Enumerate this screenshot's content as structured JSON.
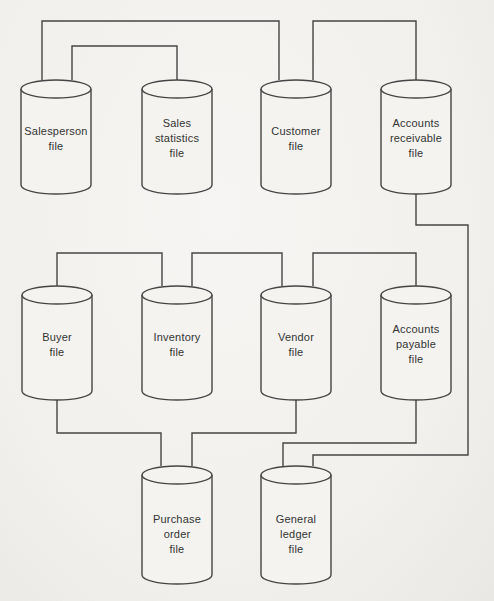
{
  "figure": {
    "description_type": "flat-file-database-diagram",
    "colors": {
      "background": "#f2f0ed",
      "stroke": "#454545",
      "text": "#333333",
      "cylinder_fill": "#f4f3f0"
    },
    "cylinder_symbol": {
      "meaning": "disk-file",
      "width": 70,
      "ellipse_ry": 9,
      "body_height": 96
    },
    "nodes": [
      {
        "id": "salesperson-file",
        "label_lines": [
          "Salesperson",
          "file"
        ],
        "cx": 56,
        "top": 80
      },
      {
        "id": "sales-statistics-file",
        "label_lines": [
          "Sales",
          "statistics",
          "file"
        ],
        "cx": 177,
        "top": 80
      },
      {
        "id": "customer-file",
        "label_lines": [
          "Customer",
          "file"
        ],
        "cx": 296,
        "top": 80
      },
      {
        "id": "accounts-receivable-file",
        "label_lines": [
          "Accounts",
          "receivable",
          "file"
        ],
        "cx": 416,
        "top": 80
      },
      {
        "id": "buyer-file",
        "label_lines": [
          "Buyer",
          "file"
        ],
        "cx": 57,
        "top": 286
      },
      {
        "id": "inventory-file",
        "label_lines": [
          "Inventory",
          "file"
        ],
        "cx": 177,
        "top": 286
      },
      {
        "id": "vendor-file",
        "label_lines": [
          "Vendor",
          "file"
        ],
        "cx": 296,
        "top": 286
      },
      {
        "id": "accounts-payable-file",
        "label_lines": [
          "Accounts",
          "payable",
          "file"
        ],
        "cx": 416,
        "top": 286
      },
      {
        "id": "purchase-order-file",
        "label_lines": [
          "Purchase",
          "order",
          "file"
        ],
        "cx": 177,
        "top": 466,
        "body_height": 100,
        "label_dy": 8
      },
      {
        "id": "general-ledger-file",
        "label_lines": [
          "General",
          "ledger",
          "file"
        ],
        "cx": 296,
        "top": 466,
        "body_height": 100,
        "label_dy": 8
      }
    ],
    "edges": [
      {
        "id": "salesperson-to-customer",
        "points": [
          [
            42,
            80
          ],
          [
            42,
            21
          ],
          [
            279,
            21
          ],
          [
            279,
            80
          ]
        ]
      },
      {
        "id": "salesperson-to-sales-statistics",
        "points": [
          [
            72,
            80
          ],
          [
            72,
            46
          ],
          [
            177,
            46
          ],
          [
            177,
            80
          ]
        ]
      },
      {
        "id": "customer-to-accounts-receivable",
        "points": [
          [
            313,
            80
          ],
          [
            313,
            21
          ],
          [
            416,
            21
          ],
          [
            416,
            80
          ]
        ]
      },
      {
        "id": "accounts-receivable-to-general-ledger",
        "points": [
          [
            416,
            194
          ],
          [
            416,
            225
          ],
          [
            468,
            225
          ],
          [
            468,
            455
          ],
          [
            313,
            455
          ],
          [
            313,
            466
          ]
        ]
      },
      {
        "id": "buyer-to-inventory",
        "points": [
          [
            57,
            286
          ],
          [
            57,
            253
          ],
          [
            162,
            253
          ],
          [
            162,
            286
          ]
        ]
      },
      {
        "id": "inventory-to-vendor",
        "points": [
          [
            192,
            286
          ],
          [
            192,
            253
          ],
          [
            282,
            253
          ],
          [
            282,
            286
          ]
        ]
      },
      {
        "id": "vendor-to-accounts-payable",
        "points": [
          [
            313,
            286
          ],
          [
            313,
            253
          ],
          [
            416,
            253
          ],
          [
            416,
            286
          ]
        ]
      },
      {
        "id": "buyer-to-purchase-order",
        "points": [
          [
            57,
            400
          ],
          [
            57,
            433
          ],
          [
            161,
            433
          ],
          [
            161,
            466
          ]
        ]
      },
      {
        "id": "vendor-to-purchase-order",
        "points": [
          [
            296,
            400
          ],
          [
            296,
            433
          ],
          [
            192,
            433
          ],
          [
            192,
            466
          ]
        ]
      },
      {
        "id": "accounts-payable-to-general-ledger",
        "points": [
          [
            416,
            400
          ],
          [
            416,
            443
          ],
          [
            283,
            443
          ],
          [
            283,
            466
          ]
        ]
      }
    ]
  }
}
